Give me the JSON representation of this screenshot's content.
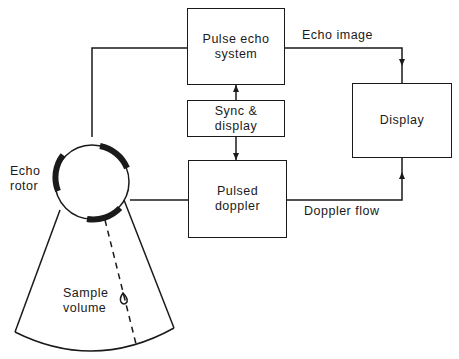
{
  "diagram": {
    "blocks": {
      "pulse_echo": {
        "line1": "Pulse echo",
        "line2": "system"
      },
      "sync": {
        "line1": "Sync &",
        "line2": "display"
      },
      "pulsed_doppler": {
        "line1": "Pulsed",
        "line2": "doppler"
      },
      "display": {
        "label": "Display"
      }
    },
    "edges": {
      "echo_image": "Echo image",
      "doppler_flow": "Doppler flow"
    },
    "rotor": {
      "line1": "Echo",
      "line2": "rotor"
    },
    "sample": {
      "line1": "Sample",
      "line2": "volume"
    }
  }
}
